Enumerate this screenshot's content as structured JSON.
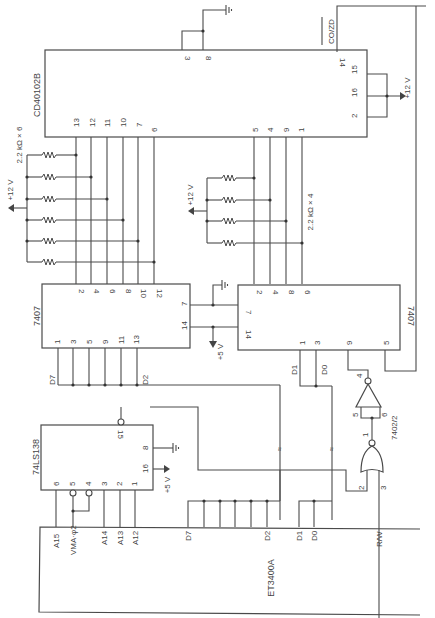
{
  "chips": {
    "counter": {
      "name": "CD40102B",
      "top_pins": [
        "3",
        "8"
      ],
      "right_pins": [
        "15",
        "16",
        "2"
      ],
      "co_pin": "14",
      "co_label": "CO/ZD",
      "out_pins_left": [
        "13",
        "12",
        "11",
        "10",
        "7",
        "6"
      ],
      "out_pins_right": [
        "5",
        "4",
        "9",
        "1"
      ]
    },
    "buffer_left": {
      "name": "7407",
      "top_pins": [
        "2",
        "4",
        "6",
        "8",
        "10",
        "12"
      ],
      "bottom_pins": [
        "1",
        "3",
        "5",
        "9",
        "11",
        "13"
      ],
      "right_pins": [
        "7",
        "14"
      ],
      "d_high": "D7",
      "d_low": "D2"
    },
    "buffer_right": {
      "name": "7407",
      "top_pins": [
        "2",
        "4",
        "8",
        "6"
      ],
      "left_pins": [
        "7",
        "14"
      ],
      "bottom_pins": [
        "1",
        "3",
        "9",
        "5"
      ],
      "d_high": "D1",
      "d_low": "D0"
    },
    "decoder": {
      "name": "74LS138",
      "pins_bottom": [
        "6",
        "5",
        "4",
        "3",
        "2",
        "1"
      ],
      "pin_out": "15",
      "pin_gnd": "8",
      "pin_vcc": "16"
    },
    "gate": {
      "name": "7402/2",
      "nor_pins": [
        "2",
        "3",
        "1"
      ],
      "inv_pins": [
        "5",
        "6",
        "4"
      ]
    },
    "cpu": {
      "name": "ET3400A",
      "signals": [
        "A15",
        "VMA·φ2",
        "A14",
        "A13",
        "A12",
        "D7",
        "D2",
        "D1",
        "D0",
        "R/W"
      ]
    }
  },
  "labels": {
    "res_left": "2.2 kΩ × 6",
    "res_right": "2.2 kΩ × 4",
    "v12_a": "+12 V",
    "v12_b": "+12 V",
    "v12_c": "+12 V",
    "v5_a": "+5 V",
    "v5_b": "+5 V"
  }
}
